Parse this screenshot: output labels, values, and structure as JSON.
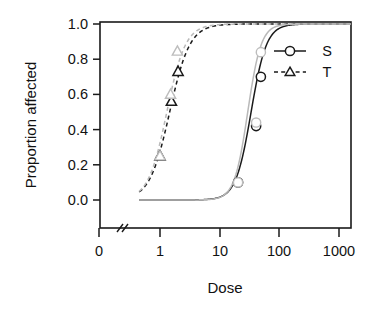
{
  "chart_data": {
    "type": "line",
    "title": "",
    "xlabel": "Dose",
    "ylabel": "Proportion affected",
    "x_scale": "log10-with-break",
    "x_tick_labels": [
      "0",
      "1",
      "10",
      "100",
      "1000"
    ],
    "x_tick_values": [
      0,
      1,
      10,
      100,
      1000
    ],
    "y_tick_labels": [
      "0.0",
      "0.2",
      "0.4",
      "0.6",
      "0.8",
      "1.0"
    ],
    "y_tick_values": [
      0.0,
      0.2,
      0.4,
      0.6,
      0.8,
      1.0
    ],
    "ylim": [
      0.0,
      1.0
    ],
    "grid": false,
    "axis_break": true,
    "legend_position": "top-right",
    "legend": [
      {
        "name": "S",
        "marker": "circle",
        "line": "solid"
      },
      {
        "name": "T",
        "marker": "triangle",
        "line": "dashed"
      }
    ],
    "series": [
      {
        "name": "S",
        "marker": "circle",
        "line": "solid",
        "color": "#1a1a1a",
        "ed50": 33,
        "slope": 3.4,
        "x": [
          20,
          40,
          48
        ],
        "values": [
          0.1,
          0.42,
          0.7
        ]
      },
      {
        "name": "T",
        "marker": "triangle",
        "line": "dashed",
        "color": "#1a1a1a",
        "ed50": 1.45,
        "slope": 2.6,
        "x": [
          1.0,
          1.55,
          2.0
        ],
        "values": [
          0.25,
          0.56,
          0.73
        ]
      },
      {
        "name": "S-ghost",
        "marker": "circle",
        "line": "solid",
        "color": "#b9b9b9",
        "ed50": 29,
        "slope": 3.9,
        "x": [
          20,
          40,
          48
        ],
        "values": [
          0.1,
          0.44,
          0.84
        ]
      },
      {
        "name": "T-ghost",
        "marker": "triangle",
        "line": "dashed",
        "color": "#b9b9b9",
        "ed50": 1.3,
        "slope": 2.8,
        "x": [
          1.0,
          1.5,
          1.95
        ],
        "values": [
          0.25,
          0.6,
          0.845
        ]
      }
    ]
  },
  "axis": {
    "x_title": "Dose",
    "y_title": "Proportion affected"
  },
  "legend": {
    "s_label": "S",
    "t_label": "T"
  },
  "xticks": {
    "t0": "0",
    "t1": "1",
    "t2": "10",
    "t3": "100",
    "t4": "1000"
  },
  "yticks": {
    "t0": "0.0",
    "t1": "0.2",
    "t2": "0.4",
    "t3": "0.6",
    "t4": "0.8",
    "t5": "1.0"
  }
}
